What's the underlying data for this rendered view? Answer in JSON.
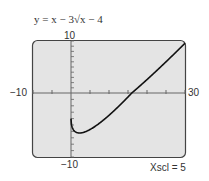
{
  "chart_data": {
    "type": "line",
    "title": "y = x − 3√x − 4",
    "xlabel": "",
    "ylabel": "",
    "xlim": [
      -10,
      30
    ],
    "ylim": [
      -10,
      10
    ],
    "xscl": 5,
    "grid": false,
    "tick_labels": {
      "x_min": "−10",
      "x_max": "30",
      "y_max": "10",
      "y_min": "−10"
    },
    "series": [
      {
        "name": "y = x − 3√x − 4",
        "x": [
          0,
          0.25,
          1,
          2.25,
          4,
          6.25,
          9,
          12.25,
          16,
          20.25,
          25,
          30
        ],
        "y": [
          -4,
          -5.25,
          -6,
          -6.25,
          -6,
          -5.5,
          -4,
          -2.25,
          0,
          2.75,
          6,
          9.57
        ]
      }
    ],
    "annotations": [
      "Xscl = 5"
    ]
  },
  "labels": {
    "equation": "y = x − 3√x − 4",
    "y_max": "10",
    "y_min": "−10",
    "x_min": "−10",
    "x_max": "30",
    "xscl": "Xscl = 5"
  },
  "colors": {
    "screen_bg": "#e4e4e4",
    "screen_border": "#444444",
    "curve": "#111111",
    "axis": "#666666"
  }
}
